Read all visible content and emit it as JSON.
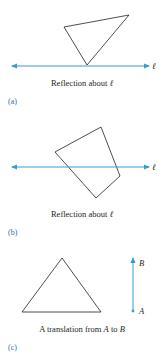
{
  "colors": {
    "line": "#3a9ad0",
    "shape": "#231f20",
    "text": "#231f20",
    "panel_label": "#2f6f9f"
  },
  "panels": [
    {
      "label": "(a)",
      "caption_prefix": "Reflection about ",
      "caption_symbol": "ℓ",
      "line_label": "ℓ",
      "shape": "triangle"
    },
    {
      "label": "(b)",
      "caption_prefix": "Reflection about ",
      "caption_symbol": "ℓ",
      "line_label": "ℓ",
      "shape": "quadrilateral"
    },
    {
      "label": "(c)",
      "caption_part1": "A translation from ",
      "caption_A": "A",
      "caption_part2": " to ",
      "caption_B": "B",
      "point_A": "A",
      "point_B": "B",
      "shape": "triangle"
    }
  ]
}
